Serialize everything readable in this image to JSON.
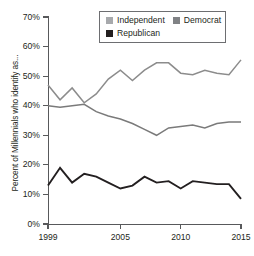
{
  "chart_data": {
    "type": "line",
    "title": "",
    "xlabel": "",
    "ylabel": "Percent of Millennials who identify as...",
    "xlim": [
      1999,
      2015
    ],
    "ylim": [
      0,
      70
    ],
    "grid": false,
    "legend_position": "top-right",
    "x": [
      1999,
      2000,
      2001,
      2002,
      2003,
      2004,
      2005,
      2006,
      2007,
      2008,
      2009,
      2010,
      2011,
      2012,
      2013,
      2014,
      2015
    ],
    "y_tick_labels": [
      "0%",
      "10%",
      "20%",
      "30%",
      "40%",
      "50%",
      "60%",
      "70%"
    ],
    "y_tick_values": [
      0,
      10,
      20,
      30,
      40,
      50,
      60,
      70
    ],
    "x_tick_labels": [
      "1999",
      "2005",
      "2010",
      "2015"
    ],
    "x_tick_values": [
      1999,
      2005,
      2010,
      2015
    ],
    "series": [
      {
        "name": "Independent",
        "color": "#8c8c8c",
        "values": [
          47,
          42,
          46,
          41,
          44,
          49,
          52,
          48.5,
          52,
          54.5,
          54.5,
          51,
          50.5,
          52,
          51,
          50.5,
          55.5
        ]
      },
      {
        "name": "Democrat",
        "color": "#7a7a7a",
        "values": [
          40,
          39.5,
          40,
          40.5,
          38,
          36.5,
          35.5,
          34,
          32,
          30,
          32.5,
          33,
          33.5,
          32.5,
          34,
          34.5,
          34.5
        ]
      },
      {
        "name": "Republican",
        "color": "#231f20",
        "values": [
          13,
          19,
          14,
          17,
          16,
          14,
          12,
          13,
          16,
          14,
          14.5,
          12,
          14.5,
          14,
          13.5,
          13.5,
          8.5
        ]
      }
    ]
  },
  "legend": {
    "entries": [
      {
        "label": "Independent",
        "swatch_color": "#a7a9ac"
      },
      {
        "label": "Democrat",
        "swatch_color": "#808285"
      },
      {
        "label": "Republican",
        "swatch_color": "#231f20"
      }
    ]
  },
  "axes": {
    "y_title": "Percent of Millennials who identify as..."
  }
}
